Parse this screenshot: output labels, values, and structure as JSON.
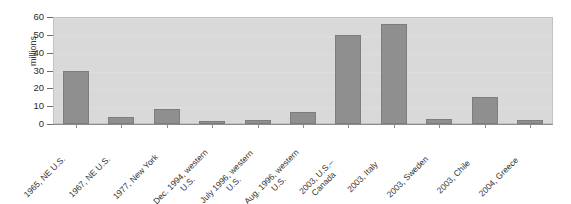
{
  "chart_data": {
    "type": "bar",
    "title": "",
    "xlabel": "",
    "ylabel": "millions",
    "ylim": [
      0,
      60
    ],
    "yticks": [
      0,
      10,
      20,
      30,
      40,
      50,
      60
    ],
    "grid": true,
    "legend": "none",
    "orientation": "vertical",
    "bar_color": "#8f8f8f",
    "plot_background": "#d9d9d9",
    "categories": [
      "1965, NE U.S.",
      "1967, NE U.S.",
      "1977, New York",
      "Dec. 1994, western\nU.S.",
      "July 1996, western\nU.S.",
      "Aug. 1996, western\nU.S.",
      "2003, U.S.–\nCanada",
      "2003, Italy",
      "2003, Sweden",
      "2003, Chile",
      "2004, Greece"
    ],
    "values": [
      30,
      4,
      8.5,
      1.5,
      2,
      6.5,
      50,
      56,
      3,
      15,
      2.5
    ]
  }
}
